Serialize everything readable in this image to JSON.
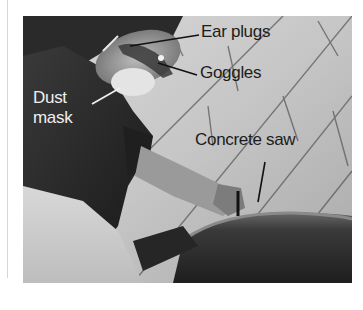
{
  "figure": {
    "tone": "grayscale",
    "labels": {
      "ear_plugs": "Ear plugs",
      "goggles": "Goggles",
      "dust_mask": "Dust mask",
      "concrete_saw": "Concrete saw"
    },
    "colors": {
      "label_dark": "#1c1c1c",
      "label_light": "#efefef",
      "wall": "#c4c4c4",
      "shirt": "#262626",
      "saw": "#2e2e2e"
    }
  }
}
